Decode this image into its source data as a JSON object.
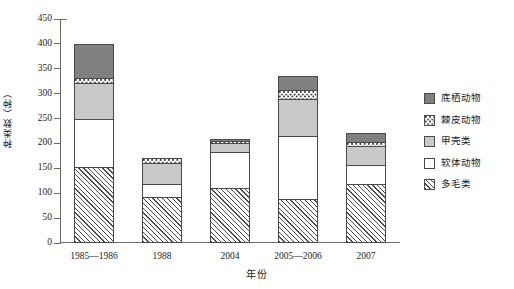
{
  "chart_data": {
    "type": "bar",
    "stacked": true,
    "title": "",
    "xlabel": "年份",
    "ylabel": "种类数（种）",
    "categories": [
      "1985—1986",
      "1988",
      "2004",
      "2005—2006",
      "2007"
    ],
    "series": [
      {
        "name": "多毛类",
        "pattern": "hatched",
        "color": "#ffffff",
        "values": [
          153,
          93,
          110,
          88,
          118
        ]
      },
      {
        "name": "软体动物",
        "pattern": "white",
        "color": "#ffffff",
        "values": [
          97,
          25,
          73,
          127,
          38
        ]
      },
      {
        "name": "甲壳类",
        "pattern": "light-gray",
        "color": "#c9c9c9",
        "values": [
          72,
          42,
          17,
          75,
          38
        ]
      },
      {
        "name": "棘皮动物",
        "pattern": "dotted",
        "color": "#ffffff",
        "values": [
          10,
          10,
          5,
          17,
          8
        ]
      },
      {
        "name": "底栖动物",
        "pattern": "dark-gray",
        "color": "#808080",
        "values": [
          68,
          0,
          5,
          28,
          20
        ]
      }
    ],
    "totals": [
      400,
      170,
      210,
      335,
      222
    ],
    "ylim": [
      0,
      450
    ],
    "yticks": [
      0,
      50,
      100,
      150,
      200,
      250,
      300,
      350,
      400,
      450
    ],
    "grid": false,
    "legend_position": "right",
    "legend_order_top_to_bottom": [
      "底栖动物",
      "棘皮动物",
      "甲壳类",
      "软体动物",
      "多毛类"
    ]
  },
  "axis": {
    "y_title": "种类数（种）",
    "x_title": "年份"
  }
}
